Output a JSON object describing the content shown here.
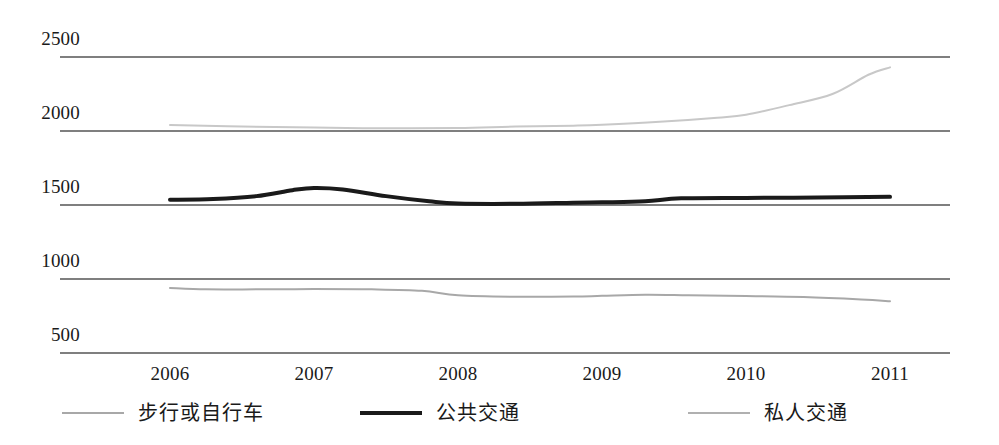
{
  "chart_data": {
    "type": "line",
    "title": "",
    "xlabel": "",
    "ylabel": "",
    "x": [
      2006,
      2007,
      2008,
      2009,
      2010,
      2011
    ],
    "categories": [
      "2006",
      "2007",
      "2008",
      "2009",
      "2010",
      "2011"
    ],
    "xtick_labels": [
      "2006",
      "2007",
      "2008",
      "2009",
      "2010",
      "2011"
    ],
    "ytick_labels": [
      "2500",
      "2000",
      "1500",
      "1000",
      "500"
    ],
    "ytick_values": [
      2500,
      2000,
      1500,
      1000,
      500
    ],
    "ylim": [
      500,
      2500
    ],
    "xlim": [
      2006,
      2011
    ],
    "grid": true,
    "grid_orientation": "horizontal",
    "legend_position": "bottom",
    "series": [
      {
        "name": "步行或自行车",
        "color": "#a8a8a8",
        "width": 2,
        "values": [
          940,
          935,
          895,
          880,
          885,
          850
        ],
        "points": [
          {
            "x": 2006,
            "y": 940
          },
          {
            "x": 2006.25,
            "y": 930
          },
          {
            "x": 2006.6,
            "y": 930
          },
          {
            "x": 2007,
            "y": 932
          },
          {
            "x": 2007.4,
            "y": 930
          },
          {
            "x": 2007.75,
            "y": 920
          },
          {
            "x": 2008,
            "y": 890
          },
          {
            "x": 2008.4,
            "y": 880
          },
          {
            "x": 2008.8,
            "y": 881
          },
          {
            "x": 2009,
            "y": 886
          },
          {
            "x": 2009.3,
            "y": 893
          },
          {
            "x": 2009.6,
            "y": 890
          },
          {
            "x": 2010,
            "y": 885
          },
          {
            "x": 2010.4,
            "y": 878
          },
          {
            "x": 2010.8,
            "y": 862
          },
          {
            "x": 2011,
            "y": 850
          }
        ]
      },
      {
        "name": "公共交通",
        "color": "#1a1a1a",
        "width": 4,
        "values": [
          1535,
          1615,
          1510,
          1515,
          1545,
          1555
        ],
        "points": [
          {
            "x": 2006,
            "y": 1535
          },
          {
            "x": 2006.3,
            "y": 1540
          },
          {
            "x": 2006.6,
            "y": 1560
          },
          {
            "x": 2006.85,
            "y": 1600
          },
          {
            "x": 2007,
            "y": 1615
          },
          {
            "x": 2007.2,
            "y": 1605
          },
          {
            "x": 2007.5,
            "y": 1560
          },
          {
            "x": 2007.8,
            "y": 1525
          },
          {
            "x": 2008,
            "y": 1510
          },
          {
            "x": 2008.4,
            "y": 1508
          },
          {
            "x": 2008.8,
            "y": 1515
          },
          {
            "x": 2009,
            "y": 1518
          },
          {
            "x": 2009.3,
            "y": 1525
          },
          {
            "x": 2009.55,
            "y": 1545
          },
          {
            "x": 2010,
            "y": 1548
          },
          {
            "x": 2010.5,
            "y": 1550
          },
          {
            "x": 2011,
            "y": 1555
          }
        ]
      },
      {
        "name": "私人交通",
        "color": "#c8c8c8",
        "width": 2,
        "values": [
          2040,
          2025,
          2020,
          2040,
          2150,
          2430
        ],
        "points": [
          {
            "x": 2006,
            "y": 2040
          },
          {
            "x": 2006.4,
            "y": 2032
          },
          {
            "x": 2007,
            "y": 2024
          },
          {
            "x": 2007.5,
            "y": 2018
          },
          {
            "x": 2008,
            "y": 2020
          },
          {
            "x": 2008.4,
            "y": 2030
          },
          {
            "x": 2008.8,
            "y": 2036
          },
          {
            "x": 2009,
            "y": 2042
          },
          {
            "x": 2009.4,
            "y": 2062
          },
          {
            "x": 2009.8,
            "y": 2090
          },
          {
            "x": 2010,
            "y": 2110
          },
          {
            "x": 2010.3,
            "y": 2175
          },
          {
            "x": 2010.6,
            "y": 2250
          },
          {
            "x": 2010.85,
            "y": 2380
          },
          {
            "x": 2011,
            "y": 2430
          }
        ]
      }
    ],
    "legend": [
      {
        "label": "步行或自行车",
        "color": "#a8a8a8",
        "width": 2
      },
      {
        "label": "公共交通",
        "color": "#1a1a1a",
        "width": 4
      },
      {
        "label": "私人交通",
        "color": "#b0b0b0",
        "width": 2
      }
    ],
    "axis_color": "#555555"
  }
}
